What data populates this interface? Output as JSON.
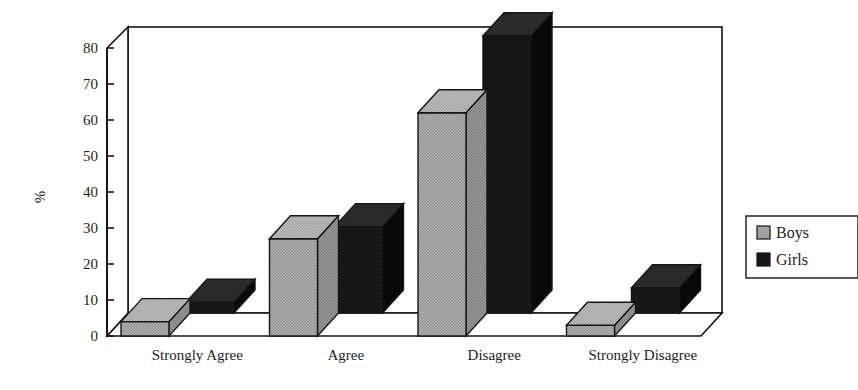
{
  "chart_data": {
    "type": "bar",
    "title": "",
    "subtitle": "",
    "xlabel": "",
    "ylabel": "%",
    "ylim": [
      0,
      80
    ],
    "yticks": [
      0,
      10,
      20,
      30,
      40,
      50,
      60,
      70,
      80
    ],
    "ytick_labels": [
      "0",
      "10",
      "20",
      "30",
      "40",
      "50",
      "60",
      "70",
      "80"
    ],
    "grid": false,
    "three_d": true,
    "legend_position": "right",
    "categories": [
      "Strongly Agree",
      "Agree",
      "Disagree",
      "Strongly Disagree"
    ],
    "series": [
      {
        "name": "Boys",
        "color": "#8c8c8c",
        "values": [
          4,
          27,
          62,
          3
        ]
      },
      {
        "name": "Girls",
        "color": "#151515",
        "values": [
          3,
          24,
          77,
          7
        ]
      }
    ]
  },
  "legend": {
    "entries": [
      {
        "label": "Boys",
        "swatch": "boys-swatch-icon"
      },
      {
        "label": "Girls",
        "swatch": "girls-swatch-icon"
      }
    ]
  },
  "colors": {
    "boys": "#8c8c8c",
    "girls": "#151515",
    "boys_top": "#a3a3a3",
    "boys_side": "#747474",
    "girls_top": "#262626",
    "girls_side": "#0b0b0b",
    "axis": "#151515",
    "background": "#ffffff"
  }
}
